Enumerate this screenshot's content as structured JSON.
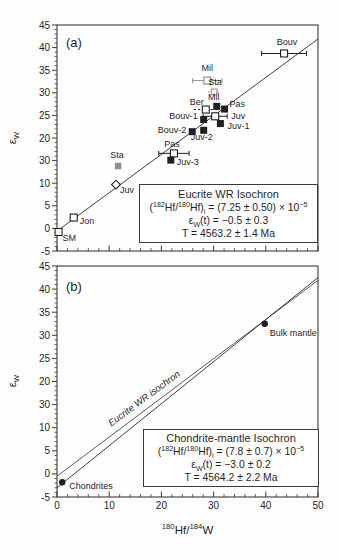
{
  "colors": {
    "ink": "#1f1f1f",
    "frame": "#3a3a3a",
    "gray_symbol": "#8f8f8f"
  },
  "axis_titles": {
    "x_parts": [
      {
        "t": "180",
        "s": 1
      },
      {
        "t": "Hf/",
        "s": 0
      },
      {
        "t": "184",
        "s": 1
      },
      {
        "t": "W",
        "s": 0
      }
    ],
    "y_parts": [
      {
        "t": "ε",
        "s": 0
      },
      {
        "t": "W",
        "s": -1
      }
    ]
  },
  "chart_data": [
    {
      "type": "scatter",
      "tag": "(a)",
      "tag_px": {
        "x": 66,
        "y": 47
      },
      "plot_px": {
        "left": 57,
        "top": 25,
        "right": 318,
        "bottom": 251
      },
      "x_range": [
        0,
        50
      ],
      "y_range": [
        -5,
        45
      ],
      "x_tick_values": [
        0,
        10,
        20,
        30,
        40,
        50
      ],
      "x_tick_labels": [],
      "y_tick_values": [
        45,
        40,
        35,
        30,
        25,
        20,
        15,
        10,
        5,
        0,
        -5
      ],
      "y_tick_labels": [
        "45",
        "40",
        "35",
        "30",
        "25",
        "20",
        "30",
        "10",
        "5",
        "0",
        "-5"
      ],
      "minor_x_step": 2,
      "minor_y_step": 1,
      "lines": [
        {
          "name": "eucrite-wr-isochron-line",
          "x": [
            0,
            50
          ],
          "y": [
            -0.6,
            41.9
          ],
          "color": "#2a2a2a"
        }
      ],
      "points": [
        {
          "label": "Bouv",
          "x": 43.5,
          "y": 38.7,
          "marker": "sq-open",
          "err": 4.3,
          "anchor": "middle",
          "dx": 3,
          "dy": -8
        },
        {
          "label": "Mil",
          "x": 28.8,
          "y": 32.7,
          "marker": "sq-open-gray",
          "err": 2.8,
          "err_color": "gray",
          "anchor": "middle",
          "dx": 0,
          "dy": -10
        },
        {
          "label": "Sta",
          "x": 30.1,
          "y": 30.2,
          "marker": "sq-open-gray-sm",
          "err": 1.2,
          "err_color": "gray",
          "err_dash": true,
          "anchor": "middle",
          "dx": 1,
          "dy": -7
        },
        {
          "label": "Mil",
          "x": 30.6,
          "y": 27.0,
          "marker": "sq-fill",
          "anchor": "middle",
          "dx": -3,
          "dy": -6
        },
        {
          "label": "Ber",
          "x": 28.5,
          "y": 26.3,
          "marker": "sq-open",
          "err": 2.3,
          "err_dash": true,
          "anchor": "end",
          "dx": -2,
          "dy": -5
        },
        {
          "label": "Pas",
          "x": 32.1,
          "y": 26.4,
          "marker": "sq-fill",
          "anchor": "start",
          "dx": 5,
          "dy": -2
        },
        {
          "label": "Juv",
          "x": 30.3,
          "y": 24.8,
          "marker": "sq-open",
          "err": 2.3,
          "anchor": "start",
          "dx": 16,
          "dy": 3
        },
        {
          "label": "Bouv-1",
          "x": 28.1,
          "y": 24.1,
          "marker": "sq-fill",
          "anchor": "end",
          "dx": -6,
          "dy": 0
        },
        {
          "label": "Juv-1",
          "x": 31.3,
          "y": 23.2,
          "marker": "sq-fill",
          "anchor": "start",
          "dx": 7,
          "dy": 5
        },
        {
          "label": "Bouv-2",
          "x": 25.9,
          "y": 21.4,
          "marker": "sq-fill",
          "anchor": "end",
          "dx": -6,
          "dy": 1
        },
        {
          "label": "Juv-2",
          "x": 28.1,
          "y": 21.7,
          "marker": "sq-fill",
          "anchor": "middle",
          "dx": -2,
          "dy": 10
        },
        {
          "label": "Pas",
          "x": 22.4,
          "y": 16.6,
          "marker": "sq-open",
          "err": 2.9,
          "anchor": "middle",
          "dx": -2,
          "dy": -6
        },
        {
          "label": "Juv-3",
          "x": 21.8,
          "y": 15.1,
          "marker": "sq-fill",
          "anchor": "start",
          "dx": 6,
          "dy": 5
        },
        {
          "label": "Sta",
          "x": 11.7,
          "y": 13.8,
          "marker": "sq-fill-gray",
          "anchor": "middle",
          "dx": -1,
          "dy": -8
        },
        {
          "label": "Juv",
          "x": 11.3,
          "y": 9.7,
          "marker": "diamond-open",
          "anchor": "start",
          "dx": 4,
          "dy": 8
        },
        {
          "label": "Jon",
          "x": 3.2,
          "y": 2.4,
          "marker": "sq-open",
          "anchor": "start",
          "dx": 6,
          "dy": 6
        },
        {
          "label": "SM",
          "x": 0.3,
          "y": -0.8,
          "marker": "sq-open",
          "anchor": "start",
          "dx": 4,
          "dy": 9
        }
      ],
      "annotation": {
        "box_px": {
          "left": 139,
          "top": 184,
          "width": 177,
          "height": 57
        },
        "lines": [
          [
            {
              "t": "Eucrite WR Isochron",
              "s": 0
            }
          ],
          [
            {
              "t": "(",
              "s": 0
            },
            {
              "t": "182",
              "s": 1
            },
            {
              "t": "Hf/",
              "s": 0
            },
            {
              "t": "180",
              "s": 1
            },
            {
              "t": "Hf)",
              "s": 0
            },
            {
              "t": "i",
              "s": -1
            },
            {
              "t": " = (7.25 ± 0.50) × 10",
              "s": 0
            },
            {
              "t": "−5",
              "s": 1
            }
          ],
          [
            {
              "t": "ε",
              "s": 0
            },
            {
              "t": "W",
              "s": -1
            },
            {
              "t": "(t) = −0.5 ± 0.3",
              "s": 0
            }
          ],
          [
            {
              "t": "T = 4563.2 ± 1.4 Ma",
              "s": 0
            }
          ]
        ]
      },
      "rotated_label": null
    },
    {
      "type": "scatter",
      "tag": "(b)",
      "tag_px": {
        "x": 66,
        "y": 291
      },
      "plot_px": {
        "left": 57,
        "top": 266,
        "right": 318,
        "bottom": 497
      },
      "x_range": [
        0,
        50
      ],
      "y_range": [
        -5,
        45
      ],
      "x_tick_values": [
        0,
        10,
        20,
        30,
        40,
        50
      ],
      "x_tick_labels": [
        "0",
        "10",
        "20",
        "30",
        "40",
        "50"
      ],
      "y_tick_values": [
        45,
        40,
        35,
        30,
        25,
        20,
        15,
        10,
        5,
        0,
        -5
      ],
      "y_tick_labels": [
        "45",
        "40",
        "35",
        "30",
        "25",
        "20",
        "30",
        "10",
        "5",
        "0",
        "-5"
      ],
      "minor_x_step": 2,
      "minor_y_step": 1,
      "lines": [
        {
          "name": "eucrite-wr-isochron-line",
          "x": [
            0,
            50
          ],
          "y": [
            -0.5,
            41.9
          ],
          "color": "#4a4a4a"
        },
        {
          "name": "chondrite-mantle-isochron-line",
          "x": [
            0,
            50
          ],
          "y": [
            -3.0,
            42.5
          ],
          "color": "#2a2a2a"
        }
      ],
      "points": [
        {
          "label": "Bulk mantle",
          "x": 39.8,
          "y": 32.5,
          "marker": "circle-fill",
          "anchor": "start",
          "dx": 5,
          "dy": 12
        },
        {
          "label": "Chondrites",
          "x": 1.0,
          "y": -1.8,
          "marker": "circle-fill",
          "anchor": "start",
          "dx": 7,
          "dy": 7
        }
      ],
      "annotation": {
        "box_px": {
          "left": 143,
          "top": 429,
          "width": 174,
          "height": 56
        },
        "lines": [
          [
            {
              "t": "Chondrite-mantle Isochron",
              "s": 0
            }
          ],
          [
            {
              "t": "(",
              "s": 0
            },
            {
              "t": "182",
              "s": 1
            },
            {
              "t": "Hf/",
              "s": 0
            },
            {
              "t": "180",
              "s": 1
            },
            {
              "t": "Hf)",
              "s": 0
            },
            {
              "t": "i",
              "s": -1
            },
            {
              "t": " = (7.8 ± 0.7) × 10",
              "s": 0
            },
            {
              "t": "−5",
              "s": 1
            }
          ],
          [
            {
              "t": "ε",
              "s": 0
            },
            {
              "t": "W",
              "s": -1
            },
            {
              "t": "(t) = −3.0 ± 0.2",
              "s": 0
            }
          ],
          [
            {
              "t": "T = 4564.2 ± 2.2 Ma",
              "s": 0
            }
          ]
        ]
      },
      "rotated_label": {
        "text": "Eucrite WR isochron",
        "px": 146,
        "py": 401,
        "angle": -36.5
      }
    }
  ]
}
